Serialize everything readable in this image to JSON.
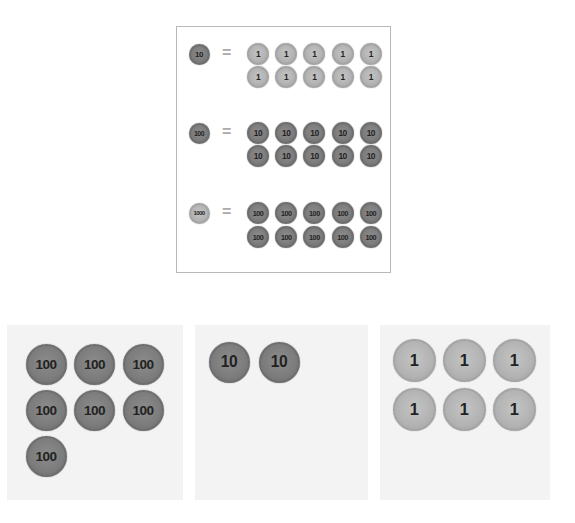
{
  "legend": {
    "rows": [
      {
        "left": {
          "label": "10",
          "tone": "dark"
        },
        "equals": "=",
        "right": {
          "label": "1",
          "tone": "light",
          "count": 10
        }
      },
      {
        "left": {
          "label": "100",
          "tone": "dark"
        },
        "equals": "=",
        "right": {
          "label": "10",
          "tone": "dark",
          "count": 10
        }
      },
      {
        "left": {
          "label": "1000",
          "tone": "light"
        },
        "equals": "=",
        "right": {
          "label": "100",
          "tone": "dark",
          "count": 10
        }
      }
    ]
  },
  "panels": [
    {
      "name": "hundreds",
      "coin_label": "100",
      "tone": "dark",
      "count": 7
    },
    {
      "name": "tens",
      "coin_label": "10",
      "tone": "dark",
      "count": 2
    },
    {
      "name": "ones",
      "coin_label": "1",
      "tone": "light",
      "count": 6
    }
  ],
  "colors": {
    "dark_coin": "#7c7c7c",
    "light_coin": "#b3b3b3",
    "panel_bg": "#f3f3f3",
    "border": "#b8b8b8"
  }
}
